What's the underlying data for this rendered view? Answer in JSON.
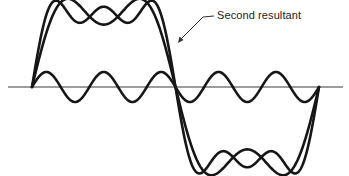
{
  "diagram": {
    "annotation": {
      "label": "Second resultant",
      "x": 217,
      "y": 10
    },
    "axis": {
      "y": 87,
      "x_start": 8,
      "x_end": 343
    },
    "waveform": {
      "x_start": 32,
      "x_end": 319,
      "amplitude_px": 75
    },
    "curves": [
      {
        "name": "first-resultant",
        "harmonics": [
          1,
          3
        ]
      },
      {
        "name": "second-resultant",
        "harmonics": [
          1,
          3,
          5
        ]
      },
      {
        "name": "fifth-harmonic",
        "harmonics": [
          5
        ],
        "standalone": true
      }
    ],
    "colors": {
      "line": "#161616",
      "axis": "#3a3a3a",
      "background": "#ffffff"
    }
  }
}
